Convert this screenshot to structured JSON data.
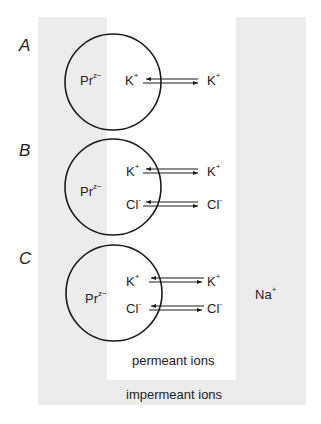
{
  "colors": {
    "impermeant_region": "#ececec",
    "permeant_region": "#ffffff",
    "stroke": "#1a1a1a"
  },
  "panels": [
    {
      "letter": "A",
      "inside": {
        "protein": "Pr",
        "protein_charge": "z−"
      },
      "ions": [
        {
          "inside": "K",
          "inside_charge": "+",
          "outside": "K",
          "outside_charge": "+",
          "arrows": "bidirectional"
        }
      ]
    },
    {
      "letter": "B",
      "inside": {
        "protein": "Pr",
        "protein_charge": "z−"
      },
      "ions": [
        {
          "inside": "K",
          "inside_charge": "+",
          "outside": "K",
          "outside_charge": "+",
          "arrows": "bidirectional"
        },
        {
          "inside": "Cl",
          "inside_charge": "-",
          "outside": "Cl",
          "outside_charge": "-",
          "arrows": "bidirectional"
        }
      ]
    },
    {
      "letter": "C",
      "inside": {
        "protein": "Pr",
        "protein_charge": "z−"
      },
      "ions": [
        {
          "inside": "K",
          "inside_charge": "+",
          "outside": "K",
          "outside_charge": "+",
          "arrows": "bidirectional"
        },
        {
          "inside": "Cl",
          "inside_charge": "-",
          "outside": "Cl",
          "outside_charge": "-",
          "arrows": "bidirectional"
        }
      ],
      "external_ion": {
        "name": "Na",
        "charge": "+"
      }
    }
  ],
  "regions": {
    "permeant_label": "permeant ions",
    "impermeant_label": "impermeant ions"
  }
}
